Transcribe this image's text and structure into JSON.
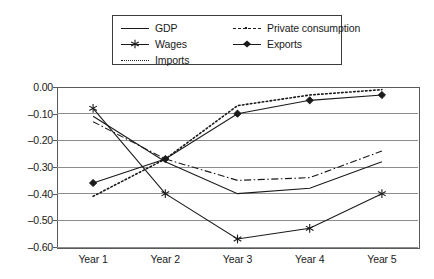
{
  "chart_data": {
    "type": "line",
    "title": "",
    "xlabel": "",
    "ylabel": "",
    "categories": [
      "Year 1",
      "Year 2",
      "Year 3",
      "Year 4",
      "Year 5"
    ],
    "ylim": [
      -0.6,
      0.0
    ],
    "ytick_labels": [
      "0.00",
      "-0.10",
      "-0.20",
      "-0.30",
      "-0.40",
      "-0.50",
      "-0.60"
    ],
    "ytick_values": [
      0.0,
      -0.1,
      -0.2,
      -0.3,
      -0.4,
      -0.5,
      -0.6
    ],
    "grid": true,
    "legend_position": "top-center",
    "series": [
      {
        "name": "GDP",
        "style": "solid",
        "marker": "none",
        "values": [
          -0.11,
          -0.28,
          -0.4,
          -0.38,
          -0.28
        ]
      },
      {
        "name": "Private consumption",
        "style": "dash-dot",
        "marker": "none",
        "values": [
          -0.13,
          -0.27,
          -0.35,
          -0.34,
          -0.24
        ]
      },
      {
        "name": "Wages",
        "style": "solid",
        "marker": "asterisk",
        "values": [
          -0.08,
          -0.4,
          -0.57,
          -0.53,
          -0.4
        ]
      },
      {
        "name": "Exports",
        "style": "solid",
        "marker": "diamond",
        "values": [
          -0.36,
          -0.27,
          -0.1,
          -0.05,
          -0.03
        ]
      },
      {
        "name": "Imports",
        "style": "dotted",
        "marker": "none",
        "values": [
          -0.41,
          -0.27,
          -0.07,
          -0.03,
          -0.01
        ]
      }
    ]
  },
  "legend": {
    "entries": [
      {
        "label": "GDP",
        "icon": "solid-line-icon"
      },
      {
        "label": "Private consumption",
        "icon": "dash-dot-line-icon"
      },
      {
        "label": "Wages",
        "icon": "asterisk-marker-line-icon"
      },
      {
        "label": "Exports",
        "icon": "diamond-marker-line-icon"
      },
      {
        "label": "Imports",
        "icon": "dotted-line-icon"
      }
    ]
  },
  "colors": {
    "series": "#1a1a1a",
    "gridline": "#8c8c8c",
    "frame": "#5a5a5a",
    "background": "#ffffff"
  }
}
